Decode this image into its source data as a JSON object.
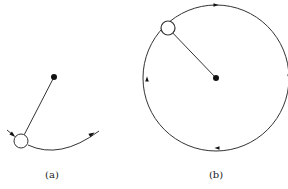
{
  "figure": {
    "stroke_color": "#333333",
    "fill_dot": "#111111",
    "panels": [
      {
        "id": "a",
        "label": "(a)",
        "label_pos": [
          52,
          176
        ],
        "pivot": [
          54,
          77
        ],
        "bob": {
          "center": [
            21,
            141
          ],
          "radius": 7
        },
        "path_arc": "M 28 145 Q 60 160 99 131",
        "arrow_on_path": {
          "at": [
            92,
            134
          ],
          "angle": -28
        },
        "incoming_arrow": {
          "from": [
            7,
            130
          ],
          "to": [
            13,
            135
          ]
        }
      },
      {
        "id": "b",
        "label": "(b)",
        "label_pos": [
          216,
          176
        ],
        "pivot": [
          216,
          78
        ],
        "orbit_radius": 73,
        "bob": {
          "center": [
            168,
            28
          ],
          "radius": 7
        },
        "arrow_ticks": [
          {
            "at": [
              216,
              5
            ],
            "angle": 0
          },
          {
            "at": [
              289,
              77
            ],
            "angle": 90
          },
          {
            "at": [
              217,
              148
            ],
            "angle": 180
          },
          {
            "at": [
              147,
              79
            ],
            "angle": 270
          }
        ]
      }
    ]
  }
}
